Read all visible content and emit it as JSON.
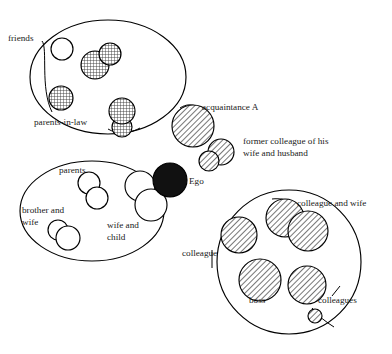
{
  "diagram": {
    "background_color": "#ffffff",
    "line_color": "#000000",
    "text_color": "#1a1a1a"
  },
  "labels": {
    "friends": "friends",
    "parents_in_law": "parents-in-law",
    "acquaintance_a": "acquaintance A",
    "former_colleague_line1": "former colleague of his",
    "former_colleague_line2": "wife and husband",
    "ego": "Ego",
    "parents": "parents",
    "brother_and_wife_line1": "brother and",
    "brother_and_wife_line2": "wife",
    "wife_and_child_line1": "wife and",
    "wife_and_child_line2": "child",
    "colleague": "colleague",
    "colleague_and_wife": "colleague and wife",
    "boss": "boss",
    "colleagues": "colleagues"
  },
  "groups": [
    {
      "name": "friends-group",
      "label": "friends",
      "cx": 108,
      "cy": 77,
      "rx": 78,
      "ry": 57
    },
    {
      "name": "family-group",
      "label": "family",
      "cx": 92,
      "cy": 211,
      "rx": 72,
      "ry": 50
    },
    {
      "name": "work-group",
      "label": "colleagues",
      "cx": 289,
      "cy": 262,
      "rx": 72,
      "ry": 72
    }
  ],
  "nodes": [
    {
      "name": "friend-open",
      "group": "friends-group",
      "fill": "plain",
      "cx": 62,
      "cy": 49,
      "r": 11
    },
    {
      "name": "friend-pair-left",
      "group": "friends-group",
      "fill": "grid",
      "cx": 95,
      "cy": 65,
      "r": 14
    },
    {
      "name": "friend-pair-right",
      "group": "friends-group",
      "fill": "grid",
      "cx": 110,
      "cy": 54,
      "r": 11
    },
    {
      "name": "friend-single",
      "group": "friends-group",
      "fill": "grid",
      "cx": 61,
      "cy": 98,
      "r": 12
    },
    {
      "name": "parents-in-law-upper",
      "group": "friends-group",
      "fill": "grid",
      "cx": 122,
      "cy": 111,
      "r": 13
    },
    {
      "name": "parents-in-law-lower",
      "group": "friends-group",
      "fill": "grid",
      "cx": 122,
      "cy": 127,
      "r": 10
    },
    {
      "name": "acquaintance-a",
      "group": "none",
      "fill": "diag",
      "cx": 193,
      "cy": 126,
      "r": 21
    },
    {
      "name": "former-colleague-wife",
      "group": "none",
      "fill": "diag",
      "cx": 221,
      "cy": 152,
      "r": 13
    },
    {
      "name": "former-colleague-husband",
      "group": "none",
      "fill": "diag",
      "cx": 209,
      "cy": 161,
      "r": 10
    },
    {
      "name": "ego",
      "group": "none",
      "fill": "solid",
      "cx": 170,
      "cy": 180,
      "r": 17
    },
    {
      "name": "parent-upper",
      "group": "family-group",
      "fill": "plain",
      "cx": 89,
      "cy": 183,
      "r": 11
    },
    {
      "name": "parent-lower",
      "group": "family-group",
      "fill": "plain",
      "cx": 97,
      "cy": 198,
      "r": 11
    },
    {
      "name": "brother",
      "group": "family-group",
      "fill": "plain",
      "cx": 58,
      "cy": 230,
      "r": 10
    },
    {
      "name": "brother-wife",
      "group": "family-group",
      "fill": "plain",
      "cx": 68,
      "cy": 238,
      "r": 12
    },
    {
      "name": "wife",
      "group": "family-group",
      "fill": "plain",
      "cx": 140,
      "cy": 186,
      "r": 15
    },
    {
      "name": "child",
      "group": "family-group",
      "fill": "plain",
      "cx": 151,
      "cy": 205,
      "r": 16
    },
    {
      "name": "colleague-left",
      "group": "work-group",
      "fill": "diag",
      "cx": 239,
      "cy": 235,
      "r": 18
    },
    {
      "name": "colleague-and-wife-left",
      "group": "work-group",
      "fill": "diag",
      "cx": 285,
      "cy": 218,
      "r": 19
    },
    {
      "name": "colleague-and-wife-right",
      "group": "work-group",
      "fill": "diag",
      "cx": 308,
      "cy": 231,
      "r": 20
    },
    {
      "name": "boss",
      "group": "work-group",
      "fill": "diag",
      "cx": 260,
      "cy": 280,
      "r": 21
    },
    {
      "name": "colleague-right",
      "group": "work-group",
      "fill": "diag",
      "cx": 307,
      "cy": 285,
      "r": 19
    },
    {
      "name": "colleague-small",
      "group": "work-group",
      "fill": "diag",
      "cx": 315,
      "cy": 316,
      "r": 7
    }
  ],
  "text_positions": [
    {
      "name": "friends",
      "x": 8,
      "y": 41
    },
    {
      "name": "parents-in-law",
      "x": 34,
      "y": 125
    },
    {
      "name": "acquaintance-a",
      "x": 202,
      "y": 110
    },
    {
      "name": "former-colleague",
      "x": 243,
      "y": 144
    },
    {
      "name": "ego",
      "x": 189,
      "y": 184
    },
    {
      "name": "parents",
      "x": 59,
      "y": 173
    },
    {
      "name": "brother-and-wife",
      "x": 27,
      "y": 210
    },
    {
      "name": "wife-and-child",
      "x": 107,
      "y": 225
    },
    {
      "name": "colleague",
      "x": 184,
      "y": 256
    },
    {
      "name": "colleague-and-wife",
      "x": 297,
      "y": 206
    },
    {
      "name": "boss",
      "x": 250,
      "y": 300
    },
    {
      "name": "colleagues",
      "x": 317,
      "y": 303
    }
  ]
}
